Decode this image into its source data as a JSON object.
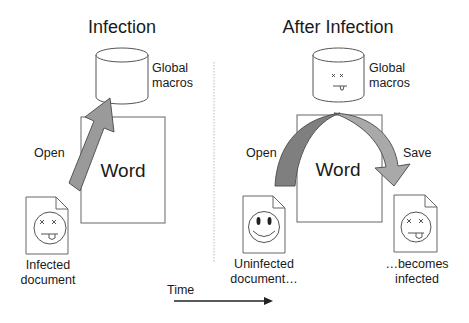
{
  "left_panel": {
    "title": "Infection",
    "cylinder_label_1": "Global",
    "cylinder_label_2": "macros",
    "app_label": "Word",
    "arrow_label": "Open",
    "doc_caption_1": "Infected",
    "doc_caption_2": "document",
    "doc_face": "infected-face-icon",
    "cylinder_face": "none"
  },
  "right_panel": {
    "title": "After Infection",
    "cylinder_label_1": "Global",
    "cylinder_label_2": "macros",
    "app_label": "Word",
    "arrow_open_label": "Open",
    "arrow_save_label": "Save",
    "source_caption_1": "Uninfected",
    "source_caption_2": "document…",
    "source_face": "smiley-face-icon",
    "target_caption_1": "…becomes",
    "target_caption_2": "infected",
    "target_face": "infected-face-icon",
    "cylinder_face": "infected-face-icon"
  },
  "timeline": {
    "label": "Time"
  },
  "colors": {
    "stroke": "#555555",
    "arrow_dark": "#7a7a7a",
    "arrow_light": "#a9a9a9",
    "text": "#1a1a1a",
    "divider": "#bbbbbb"
  }
}
